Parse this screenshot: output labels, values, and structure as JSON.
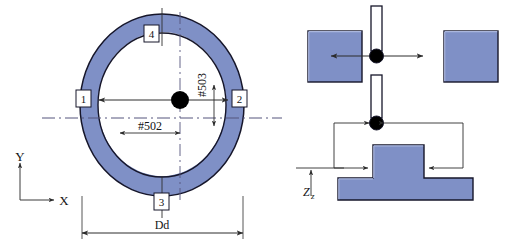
{
  "figure": {
    "colors": {
      "part_fill": "#7f90c6",
      "part_fill_light": "#8e9ed0",
      "outline": "#1b1b2a",
      "dimension_line": "#3a3a3a",
      "centerline": "#5a5a7a",
      "probe_tip": "#000000",
      "stylus_fill": "#ffffff",
      "background": "#ffffff"
    }
  },
  "left_view": {
    "name": "bore-ring-view",
    "callouts": [
      {
        "id": "1",
        "label": "1",
        "position": "left"
      },
      {
        "id": "2",
        "label": "2",
        "position": "right"
      },
      {
        "id": "3",
        "label": "3",
        "position": "bottom"
      },
      {
        "id": "4",
        "label": "4",
        "position": "top"
      }
    ],
    "dimensions": [
      {
        "name": "bore-diameter",
        "label": "Dd",
        "orientation": "horizontal"
      },
      {
        "name": "x-offset",
        "label": "#502",
        "orientation": "horizontal"
      },
      {
        "name": "y-offset",
        "label": "#503",
        "orientation": "vertical"
      }
    ],
    "axis_indicator": {
      "name": "coordinate-axes",
      "x_label": "X",
      "y_label": "Y"
    },
    "center_marker": {
      "name": "probe-center-point"
    }
  },
  "right_view": {
    "name": "probe-approach-view",
    "upper": {
      "name": "horizontal-probing-scene",
      "left_block_label": "",
      "right_block_label": "",
      "stylus_label": "",
      "arrows": [
        {
          "name": "probe-arrow-left",
          "direction": "left"
        },
        {
          "name": "probe-arrow-right",
          "direction": "right"
        }
      ]
    },
    "lower": {
      "name": "boss-probing-scene",
      "dimensions": [
        {
          "name": "z-height",
          "label": "Zz",
          "label_main": "Z",
          "label_sub": "z",
          "orientation": "vertical"
        }
      ],
      "arrows": [
        {
          "name": "boss-arrow-left",
          "direction": "right"
        },
        {
          "name": "boss-arrow-right",
          "direction": "left"
        }
      ]
    }
  }
}
